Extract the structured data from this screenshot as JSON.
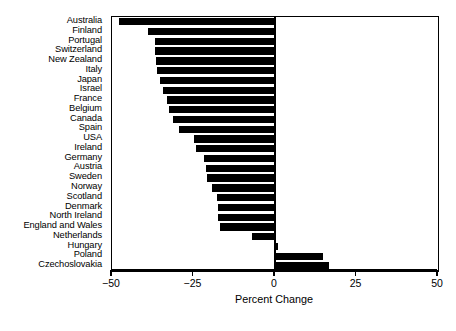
{
  "chart_data": {
    "type": "bar",
    "orientation": "horizontal",
    "title": "",
    "subtitle": "",
    "xlabel": "Percent Change",
    "ylabel": "",
    "xlim": [
      -50,
      50
    ],
    "xticks": [
      -50,
      -25,
      0,
      25,
      50
    ],
    "xtick_labels": [
      "−50",
      "−25",
      "0",
      "25",
      "50"
    ],
    "grid": false,
    "legend": null,
    "bar_color": "#000000",
    "categories": [
      "Australia",
      "Finland",
      "Portugal",
      "Switzerland",
      "New Zealand",
      "Italy",
      "Japan",
      "Israel",
      "France",
      "Belgium",
      "Canada",
      "Spain",
      "USA",
      "Ireland",
      "Germany",
      "Austria",
      "Sweden",
      "Norway",
      "Scotland",
      "Denmark",
      "North Ireland",
      "England and Wales",
      "Netherlands",
      "Hungary",
      "Poland",
      "Czechoslovakia"
    ],
    "values": [
      -47.7,
      -39.0,
      -36.8,
      -36.8,
      -36.5,
      -36.2,
      -35.3,
      -34.4,
      -33.1,
      -32.5,
      -31.3,
      -29.4,
      -24.8,
      -24.2,
      -21.8,
      -21.2,
      -20.9,
      -19.3,
      -17.8,
      -17.5,
      -17.5,
      -16.9,
      -7.1,
      1.0,
      14.7,
      16.6
    ]
  }
}
